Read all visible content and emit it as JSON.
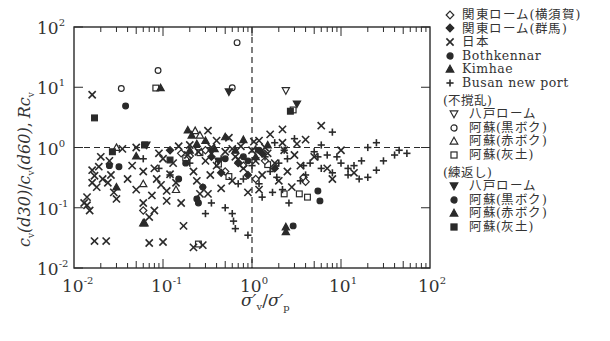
{
  "chart_data": {
    "type": "scatter",
    "xlabel": "σ′v/σ′p",
    "ylabel": "cv(d30)/cv(d60), Rcv",
    "xscale": "log",
    "yscale": "log",
    "xlim": [
      0.01,
      100
    ],
    "ylim": [
      0.01,
      100
    ],
    "x_ticks": [
      "10^-2",
      "10^-1",
      "10^0",
      "10^1",
      "10^2"
    ],
    "y_ticks": [
      "10^-2",
      "10^-1",
      "10^0",
      "10^1",
      "10^2"
    ],
    "reference_lines": [
      {
        "orientation": "vertical",
        "value": 1,
        "style": "dashed"
      },
      {
        "orientation": "horizontal",
        "value": 1,
        "style": "dashed"
      }
    ],
    "grid": false,
    "legend_position": "right",
    "legend": {
      "main": [
        {
          "marker": "diamond-open",
          "label": "関東ローム(横須賀)"
        },
        {
          "marker": "diamond-filled",
          "label": "関東ローム(群馬)"
        },
        {
          "marker": "x",
          "label": "日本"
        },
        {
          "marker": "circle-filled",
          "label": "Bothkennar"
        },
        {
          "marker": "triangle-filled",
          "label": "Kimhae"
        },
        {
          "marker": "plus",
          "label": "Busan new port"
        }
      ],
      "undisturbed_title": "(不撹乱)",
      "undisturbed": [
        {
          "marker": "triangle-down-open",
          "label": "八戸ローム"
        },
        {
          "marker": "circle-open",
          "label": "阿蘇(黒ボク)"
        },
        {
          "marker": "triangle-open",
          "label": "阿蘇(赤ボク)"
        },
        {
          "marker": "square-open",
          "label": "阿蘇(灰土)"
        }
      ],
      "remolded_title": "(練返し)",
      "remolded": [
        {
          "marker": "triangle-down-filled",
          "label": "八戸ローム"
        },
        {
          "marker": "circle-filled",
          "label": "阿蘇(黒ボク)"
        },
        {
          "marker": "triangle-filled",
          "label": "阿蘇(赤ボク)"
        },
        {
          "marker": "square-filled",
          "label": "阿蘇(灰土)"
        }
      ]
    },
    "series": [
      {
        "name": "阿蘇(黒ボク) 不撹乱",
        "marker": "circle-open",
        "points": [
          [
            0.68,
            55
          ],
          [
            0.088,
            19
          ],
          [
            0.034,
            9.5
          ],
          [
            0.6,
            9.8
          ]
        ]
      },
      {
        "name": "八戸ローム 不撹乱",
        "marker": "triangle-down-open",
        "points": [
          [
            2.4,
            8.8
          ]
        ]
      },
      {
        "name": "阿蘇(灰土) 不撹乱",
        "marker": "square-open",
        "points": [
          [
            0.083,
            9.7
          ],
          [
            2.9,
            4.2
          ],
          [
            0.26,
            0.82
          ],
          [
            0.18,
            0.67
          ],
          [
            0.55,
            0.33
          ],
          [
            0.42,
            0.53
          ],
          [
            1.5,
            0.52
          ],
          [
            2.3,
            0.17
          ],
          [
            3.4,
            0.17
          ],
          [
            4.2,
            0.15
          ],
          [
            0.25,
            0.025
          ]
        ]
      },
      {
        "name": "阿蘇(赤ボク) 不撹乱",
        "marker": "triangle-open",
        "points": [
          [
            0.03,
            1.0
          ],
          [
            0.23,
            1.9
          ],
          [
            0.26,
            1.6
          ],
          [
            0.06,
            0.25
          ],
          [
            0.14,
            0.2
          ]
        ]
      },
      {
        "name": "阿蘇(灰土) 練返し",
        "marker": "square-filled",
        "points": [
          [
            0.017,
            3.1
          ],
          [
            0.027,
            0.85
          ],
          [
            0.12,
            0.62
          ],
          [
            2.7,
            4.0
          ],
          [
            0.062,
            1.1
          ]
        ]
      },
      {
        "name": "阿蘇(黒ボク) 練返し",
        "marker": "circle-filled",
        "points": [
          [
            0.038,
            4.9
          ],
          [
            0.025,
            0.5
          ],
          [
            0.032,
            0.48
          ],
          [
            0.18,
            0.55
          ],
          [
            0.24,
            0.14
          ],
          [
            0.25,
            0.12
          ],
          [
            2.9,
            0.05
          ],
          [
            5.8,
            0.13
          ],
          [
            5.5,
            0.19
          ],
          [
            0.5,
            0.65
          ]
        ]
      },
      {
        "name": "阿蘇(赤ボク) 練返し",
        "marker": "triangle-filled",
        "points": [
          [
            0.094,
            9.8
          ],
          [
            0.19,
            1.95
          ],
          [
            0.21,
            1.6
          ],
          [
            0.05,
            0.72
          ],
          [
            0.03,
            0.22
          ],
          [
            0.06,
            0.056
          ],
          [
            0.062,
            0.056
          ],
          [
            0.38,
            0.95
          ],
          [
            2.4,
            0.048
          ],
          [
            2.4,
            0.04
          ],
          [
            0.2,
            0.9
          ],
          [
            0.24,
            1.15
          ],
          [
            0.3,
            1.3
          ]
        ]
      },
      {
        "name": "八戸ローム 練返し",
        "marker": "triangle-down-filled",
        "points": [
          [
            0.55,
            8.4
          ],
          [
            0.065,
            1.1
          ],
          [
            3.2,
            5.3
          ],
          [
            0.35,
            0.85
          ],
          [
            0.42,
            0.6
          ]
        ]
      },
      {
        "name": "関東ローム(横須賀)",
        "marker": "diamond-open",
        "points": [
          [
            0.16,
            0.8
          ],
          [
            0.2,
            0.72
          ],
          [
            0.5,
            0.4
          ],
          [
            0.8,
            0.5
          ],
          [
            1.1,
            0.3
          ],
          [
            1.4,
            0.6
          ],
          [
            0.3,
            0.9
          ],
          [
            3.8,
            0.32
          ],
          [
            4.0,
            0.27
          ],
          [
            0.06,
            0.09
          ]
        ]
      },
      {
        "name": "関東ローム(群馬)",
        "marker": "diamond-filled",
        "points": [
          [
            0.12,
            0.9
          ],
          [
            0.35,
            0.7
          ],
          [
            0.7,
            0.55
          ],
          [
            1.3,
            0.8
          ],
          [
            1.8,
            0.45
          ],
          [
            0.45,
            0.38
          ],
          [
            0.9,
            0.35
          ]
        ]
      },
      {
        "name": "Bothkennar",
        "marker": "circle-filled",
        "points": [
          [
            0.8,
            0.7
          ],
          [
            1.2,
            0.9
          ],
          [
            0.9,
            0.6
          ],
          [
            0.15,
            0.3
          ],
          [
            0.28,
            0.22
          ]
        ]
      },
      {
        "name": "Kimhae",
        "marker": "triangle-filled",
        "points": [
          [
            0.5,
            1.5
          ],
          [
            0.8,
            1.35
          ],
          [
            1.5,
            1.1
          ],
          [
            0.65,
            0.9
          ],
          [
            1.1,
            0.7
          ]
        ]
      },
      {
        "name": "日本",
        "marker": "x",
        "points": [
          [
            0.016,
            7.5
          ],
          [
            0.017,
            0.028
          ],
          [
            0.023,
            0.028
          ],
          [
            0.07,
            0.026
          ],
          [
            0.1,
            0.027
          ],
          [
            0.22,
            0.022
          ],
          [
            0.28,
            0.024
          ],
          [
            0.014,
            0.15
          ],
          [
            0.014,
            0.11
          ],
          [
            0.015,
            0.09
          ],
          [
            0.016,
            0.42
          ],
          [
            0.016,
            0.26
          ],
          [
            0.017,
            0.34
          ],
          [
            0.018,
            0.22
          ],
          [
            0.019,
            0.48
          ],
          [
            0.021,
            0.3
          ],
          [
            0.024,
            0.26
          ],
          [
            0.026,
            0.35
          ],
          [
            0.028,
            0.18
          ],
          [
            0.03,
            0.14
          ],
          [
            0.04,
            0.3
          ],
          [
            0.045,
            0.5
          ],
          [
            0.05,
            0.2
          ],
          [
            0.06,
            0.12
          ],
          [
            0.07,
            0.07
          ],
          [
            0.075,
            0.16
          ],
          [
            0.08,
            0.45
          ],
          [
            0.085,
            0.3
          ],
          [
            0.095,
            0.24
          ],
          [
            0.11,
            0.19
          ],
          [
            0.12,
            0.36
          ],
          [
            0.14,
            0.26
          ],
          [
            0.16,
            0.12
          ],
          [
            0.17,
            0.05
          ],
          [
            0.19,
            0.75
          ],
          [
            0.22,
            0.4
          ],
          [
            0.24,
            0.28
          ],
          [
            0.26,
            0.17
          ],
          [
            0.3,
            0.6
          ],
          [
            0.32,
            1.9
          ],
          [
            0.34,
            0.35
          ],
          [
            0.4,
            1.3
          ],
          [
            0.45,
            0.21
          ],
          [
            0.5,
            0.85
          ],
          [
            0.55,
            1.45
          ],
          [
            0.6,
            0.28
          ],
          [
            0.7,
            0.64
          ],
          [
            0.75,
            1.05
          ],
          [
            0.8,
            0.45
          ],
          [
            0.9,
            0.18
          ],
          [
            1.0,
            0.9
          ],
          [
            1.1,
            0.6
          ],
          [
            1.2,
            1.3
          ],
          [
            1.3,
            0.35
          ],
          [
            1.5,
            0.8
          ],
          [
            1.6,
            1.65
          ],
          [
            1.8,
            0.55
          ],
          [
            2.0,
            0.28
          ],
          [
            2.2,
            1.2
          ],
          [
            2.5,
            0.4
          ],
          [
            2.8,
            0.22
          ],
          [
            3.0,
            0.75
          ],
          [
            3.5,
            0.5
          ],
          [
            4.0,
            1.35
          ],
          [
            5.0,
            0.7
          ],
          [
            6.0,
            2.3
          ],
          [
            7.0,
            0.45
          ],
          [
            8.0,
            0.3
          ],
          [
            10.0,
            0.9
          ],
          [
            14.0,
            0.38
          ],
          [
            0.013,
            0.12
          ],
          [
            0.02,
            0.7
          ],
          [
            0.025,
            0.6
          ],
          [
            0.035,
            0.95
          ],
          [
            0.05,
            1.0
          ],
          [
            0.06,
            0.4
          ],
          [
            0.09,
            0.8
          ],
          [
            0.13,
            0.55
          ],
          [
            0.15,
            1.05
          ],
          [
            0.2,
            1.1
          ],
          [
            0.25,
            0.85
          ],
          [
            0.35,
            1.0
          ],
          [
            0.4,
            0.5
          ],
          [
            0.6,
            0.95
          ],
          [
            0.65,
            0.7
          ],
          [
            1.05,
            1.25
          ],
          [
            1.4,
            1.0
          ],
          [
            2.3,
            0.9
          ],
          [
            3.2,
            1.15
          ],
          [
            1.2,
            0.2
          ],
          [
            0.08,
            0.09
          ],
          [
            0.1,
            0.65
          ],
          [
            0.11,
            0.13
          ],
          [
            0.32,
            0.17
          ],
          [
            2.2,
            2.0
          ]
        ]
      },
      {
        "name": "Busan new port",
        "marker": "plus",
        "points": [
          [
            0.28,
            0.22
          ],
          [
            0.35,
            0.12
          ],
          [
            0.6,
            0.08
          ],
          [
            0.62,
            0.06
          ],
          [
            0.65,
            0.045
          ],
          [
            0.9,
            0.035
          ],
          [
            1.2,
            0.25
          ],
          [
            1.4,
            0.7
          ],
          [
            1.6,
            0.4
          ],
          [
            1.9,
            0.32
          ],
          [
            2.0,
            0.55
          ],
          [
            2.3,
            0.9
          ],
          [
            2.5,
            0.65
          ],
          [
            3.0,
            1.4
          ],
          [
            3.5,
            0.28
          ],
          [
            4.0,
            0.35
          ],
          [
            4.5,
            0.55
          ],
          [
            5.0,
            0.85
          ],
          [
            5.5,
            0.7
          ],
          [
            6.0,
            0.45
          ],
          [
            7.0,
            0.75
          ],
          [
            8.0,
            0.38
          ],
          [
            10.0,
            0.55
          ],
          [
            12.0,
            0.35
          ],
          [
            14.0,
            0.5
          ],
          [
            16.0,
            0.3
          ],
          [
            20.0,
            0.32
          ],
          [
            25.0,
            0.42
          ],
          [
            30.0,
            0.6
          ],
          [
            40.0,
            0.75
          ],
          [
            45.0,
            0.9
          ],
          [
            55.0,
            0.8
          ],
          [
            20.0,
            1.0
          ],
          [
            25.0,
            1.2
          ],
          [
            8.0,
            1.8
          ],
          [
            6.0,
            1.1
          ],
          [
            1.3,
            0.15
          ],
          [
            1.7,
            0.18
          ],
          [
            2.6,
            0.12
          ],
          [
            0.3,
            0.08
          ],
          [
            0.5,
            0.1
          ],
          [
            0.8,
            0.3
          ],
          [
            1.0,
            0.5
          ],
          [
            1.1,
            0.95
          ],
          [
            1.8,
            1.2
          ],
          [
            0.2,
            0.55
          ],
          [
            0.12,
            0.35
          ],
          [
            0.06,
            0.65
          ],
          [
            0.09,
            0.45
          ],
          [
            0.45,
            0.65
          ],
          [
            0.7,
            0.25
          ],
          [
            2.2,
            0.2
          ],
          [
            12.0,
            0.45
          ],
          [
            17.0,
            0.6
          ],
          [
            3.8,
            0.5
          ],
          [
            9.0,
            0.7
          ]
        ]
      }
    ]
  },
  "axes": {
    "x_tick_labels": [
      {
        "base": "10",
        "exp": "-2"
      },
      {
        "base": "10",
        "exp": "-1"
      },
      {
        "base": "10",
        "exp": "0"
      },
      {
        "base": "10",
        "exp": "1"
      },
      {
        "base": "10",
        "exp": "2"
      }
    ],
    "y_tick_labels": [
      {
        "base": "10",
        "exp": "2"
      },
      {
        "base": "10",
        "exp": "1"
      },
      {
        "base": "10",
        "exp": "0"
      },
      {
        "base": "10",
        "exp": "-1"
      },
      {
        "base": "10",
        "exp": "-2"
      }
    ],
    "xlabel": {
      "sigma": "σ",
      "prime": "′",
      "sub_v": "v",
      "slash": "/",
      "sub_p": "p"
    },
    "ylabel": {
      "c": "c",
      "sub_v": "v",
      "d30": "(d30)",
      "slash": "/",
      "d60": "(d60)",
      "comma": ",",
      "rc": "Rc"
    }
  },
  "legend": {
    "main": [
      {
        "marker": "diamond-open",
        "label": "関東ローム(横須賀)"
      },
      {
        "marker": "diamond-filled",
        "label": "関東ローム(群馬)"
      },
      {
        "marker": "x",
        "label": "日本"
      },
      {
        "marker": "circle-filled",
        "label": "Bothkennar"
      },
      {
        "marker": "triangle-filled",
        "label": "Kimhae"
      },
      {
        "marker": "plus",
        "label": "Busan new port"
      }
    ],
    "undisturbed_title": "(不撹乱)",
    "undisturbed": [
      {
        "marker": "triangle-down-open",
        "label": "八戸ローム"
      },
      {
        "marker": "circle-open",
        "label": "阿蘇(黒ボク)"
      },
      {
        "marker": "triangle-open",
        "label": "阿蘇(赤ボク)"
      },
      {
        "marker": "square-open",
        "label": "阿蘇(灰土)"
      }
    ],
    "remolded_title": "(練返し)",
    "remolded": [
      {
        "marker": "triangle-down-filled",
        "label": "八戸ローム"
      },
      {
        "marker": "circle-filled",
        "label": "阿蘇(黒ボク)"
      },
      {
        "marker": "triangle-filled",
        "label": "阿蘇(赤ボク)"
      },
      {
        "marker": "square-filled",
        "label": "阿蘇(灰土)"
      }
    ]
  },
  "colors": {
    "ink": "#2a2a2a",
    "background": "#ffffff"
  }
}
